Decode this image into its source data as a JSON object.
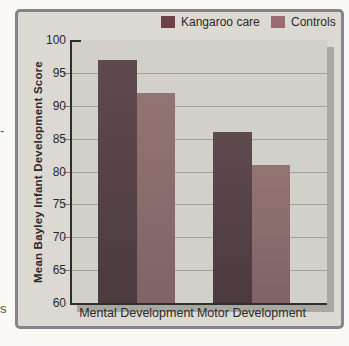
{
  "page": {
    "edge_fragments": [
      "-",
      "s"
    ]
  },
  "figure": {
    "frame_border_color": "#84858a",
    "frame_bg": "#dbd9d1",
    "plot_bg": "#d1d0c9",
    "shadow_color": "#a9a8a0",
    "gridline_color": "#a19f99",
    "axis_color": "#2e2e2e",
    "text_color": "#2a2a2a"
  },
  "chart_data": {
    "type": "bar",
    "title": "",
    "categories": [
      "Mental Development",
      "Motor Development"
    ],
    "series": [
      {
        "name": "Kangaroo care",
        "values": [
          97,
          86
        ],
        "color_top": "#5f4a4e",
        "color_bottom": "#4c3a3e",
        "legend_color": "#704147"
      },
      {
        "name": "Controls",
        "values": [
          92,
          81
        ],
        "color_top": "#927472",
        "color_bottom": "#7f6365",
        "legend_color": "#9a6b6f"
      }
    ],
    "xlabel": "",
    "ylabel": "Mean Bayley Infant Development Score",
    "ylim": [
      60,
      100
    ],
    "ytick_step": 5,
    "grid": true,
    "legend_position": "top"
  }
}
